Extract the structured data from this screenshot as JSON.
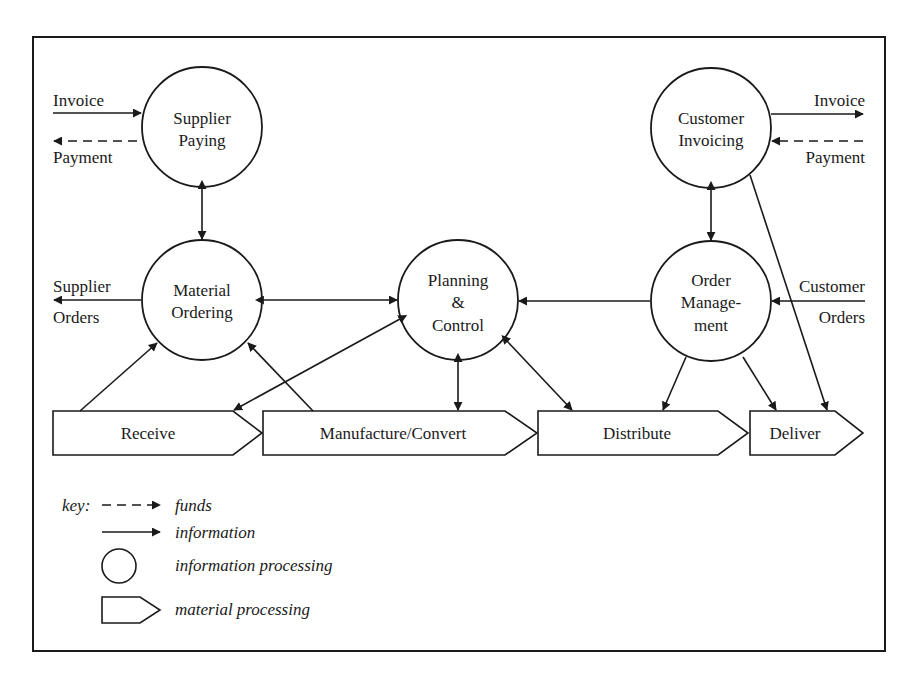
{
  "diagram": {
    "nodes": {
      "supplier_paying": {
        "line1": "Supplier",
        "line2": "Paying"
      },
      "customer_invoicing": {
        "line1": "Customer",
        "line2": "Invoicing"
      },
      "material_ordering": {
        "line1": "Material",
        "line2": "Ordering"
      },
      "planning_control": {
        "line1": "Planning",
        "line2": "&",
        "line3": "Control"
      },
      "order_management": {
        "line1": "Order",
        "line2": "Manage-",
        "line3": "ment"
      }
    },
    "processes": {
      "receive": "Receive",
      "manufacture": "Manufacture/Convert",
      "distribute": "Distribute",
      "deliver": "Deliver"
    },
    "flow_labels": {
      "left_invoice": "Invoice",
      "left_payment": "Payment",
      "right_invoice": "Invoice",
      "right_payment": "Payment",
      "supplier_orders_1": "Supplier",
      "supplier_orders_2": "Orders",
      "customer_orders_1": "Customer",
      "customer_orders_2": "Orders"
    },
    "key": {
      "title": "key:",
      "funds": "funds",
      "information": "information",
      "information_processing": "information processing",
      "material_processing": "material processing"
    }
  }
}
